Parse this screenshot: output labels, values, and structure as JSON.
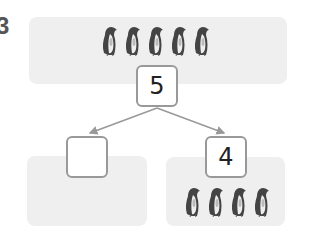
{
  "question_number": "3",
  "whole": {
    "value": "5",
    "penguin_count": 5
  },
  "parts": [
    {
      "value": "",
      "penguin_count": 0
    },
    {
      "value": "4",
      "penguin_count": 4
    }
  ],
  "colors": {
    "panel": "#efefef",
    "box_border": "#999999",
    "arrow": "#999999"
  }
}
